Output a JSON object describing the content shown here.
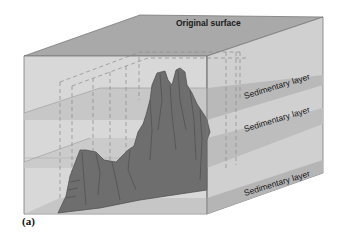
{
  "figure": {
    "caption": "(a)",
    "labels": {
      "top": "Original surface",
      "layer1": "Sedimentary layer",
      "layer2": "Sedimentary layer",
      "layer3": "Sedimentary layer"
    },
    "colors": {
      "top_face": "#a9a9a9",
      "front_face": "#d6d6d6",
      "right_face": "#cfcfcf",
      "layer_band": "#bdbdbd",
      "landform": "#6e6e6e",
      "edge": "#7a7a7a",
      "dashed": "#8a8a8a"
    }
  }
}
